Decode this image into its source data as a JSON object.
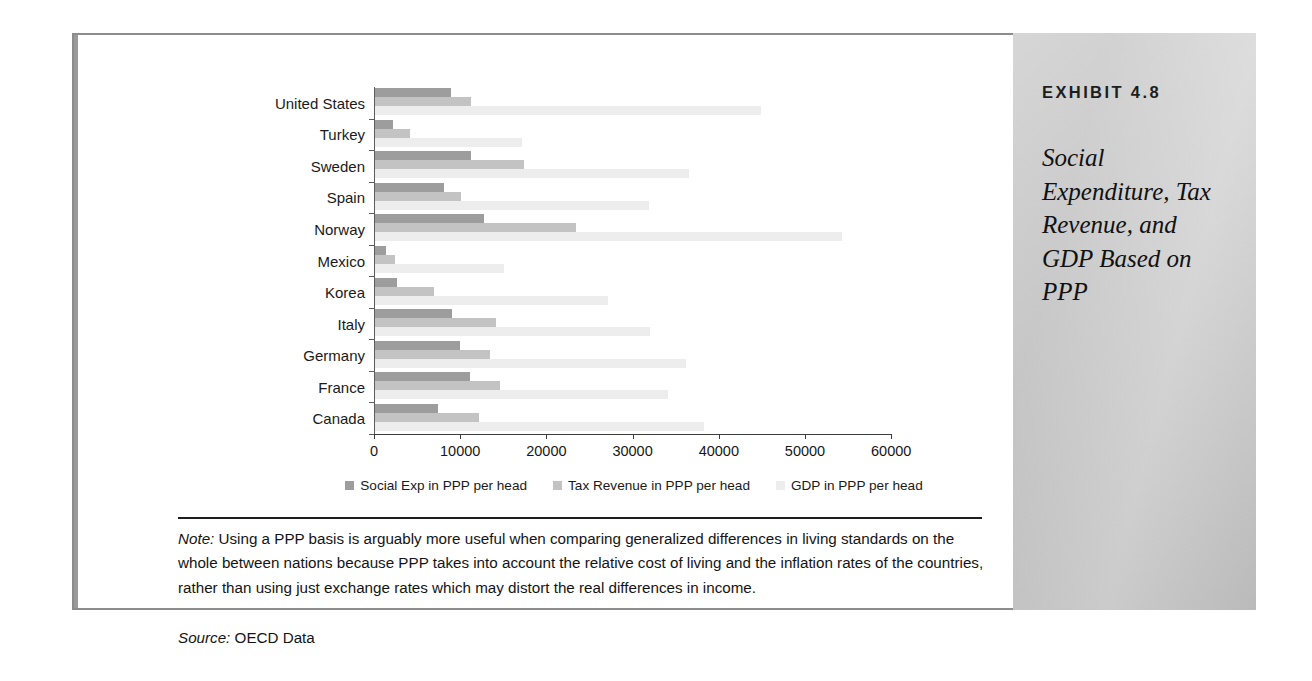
{
  "exhibit": {
    "kicker": "EXHIBIT 4.8",
    "title": "Social Expenditure, Tax Revenue, and GDP Based on PPP"
  },
  "note": {
    "label": "Note:",
    "text": " Using a PPP basis is arguably more useful when comparing generalized differences in living standards on the whole between nations because PPP takes into account the relative cost of living and the inflation rates of the countries, rather than using just exchange rates which may distort the real differences in income."
  },
  "source": {
    "label": "Source:",
    "text": " OECD Data"
  },
  "colors": {
    "series_social": "#9d9d9d",
    "series_tax": "#c3c3c3",
    "series_gdp": "#ededed",
    "panel": "#cdcdcd",
    "frame": "#8c8c8c"
  },
  "chart_data": {
    "type": "bar",
    "orientation": "horizontal",
    "title": "Social Expenditure, Tax Revenue, and GDP Based on PPP",
    "xlabel": "",
    "ylabel": "",
    "xlim": [
      0,
      60000
    ],
    "xticks": [
      0,
      10000,
      20000,
      30000,
      40000,
      50000,
      60000
    ],
    "xtick_labels": [
      "0",
      "10000",
      "20000",
      "30000",
      "40000",
      "50000",
      "60000"
    ],
    "grid": false,
    "legend_position": "bottom",
    "categories": [
      "United States",
      "Turkey",
      "Sweden",
      "Spain",
      "Norway",
      "Mexico",
      "Korea",
      "Italy",
      "Germany",
      "France",
      "Canada"
    ],
    "series": [
      {
        "name": "Social Exp in PPP per head",
        "color": "#9d9d9d",
        "values": [
          8800,
          2100,
          11100,
          8000,
          12600,
          1300,
          2600,
          8900,
          9900,
          11000,
          7300
        ]
      },
      {
        "name": "Tax Revenue in PPP per head",
        "color": "#c3c3c3",
        "values": [
          11100,
          4100,
          17300,
          10000,
          23300,
          2300,
          6800,
          14000,
          13300,
          14500,
          12100
        ]
      },
      {
        "name": "GDP in PPP per head",
        "color": "#ededed",
        "values": [
          44800,
          17000,
          36400,
          31800,
          54200,
          15000,
          27000,
          31900,
          36100,
          34000,
          38200
        ]
      }
    ]
  }
}
